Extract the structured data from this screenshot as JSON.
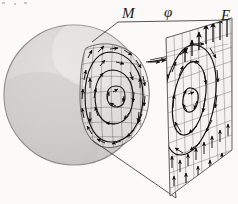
{
  "figure": {
    "kind": "scientific-line-diagram",
    "background_color": "#fbfaf8",
    "ink_color": "#1a1a1a",
    "width": 238,
    "height": 204
  },
  "labels": {
    "M": "M",
    "phi": "φ",
    "E": "E"
  },
  "sphere": {
    "name": "shaded-sphere",
    "center_x": 74,
    "center_y": 95,
    "radius": 70,
    "fill_light": "#f2f1ef",
    "fill_mid": "#dcdbd8",
    "fill_dark": "#c2c1be",
    "outline_color": "#8e8d8a",
    "texture": "stipple"
  },
  "sphere_patch": {
    "name": "curved-field-patch",
    "grid_color": "#5a5a5a",
    "contour_color": "#1a1a1a",
    "contour_count": 3,
    "arrow_color": "#111111",
    "description": "curved quadrilateral patch on the sphere carrying a circulating vector field with concentric closed contours"
  },
  "plane": {
    "name": "projection-plane",
    "grid_color": "#6a6a6a",
    "contour_color": "#1a1a1a",
    "contour_count": 3,
    "arrow_color": "#111111",
    "fill": "#f0efed",
    "corners": [
      [
        166,
        38
      ],
      [
        232,
        18
      ],
      [
        232,
        150
      ],
      [
        170,
        196
      ]
    ],
    "description": "flat parallelogram plane to the right showing the projected vector field with concentric closed contours and upward arrows along the right edge"
  },
  "projection_lines": {
    "name": "projection-rays",
    "color": "#2b2b2b",
    "count": 4,
    "description": "straight rays connecting the sphere patch boundary to the plane corners"
  }
}
